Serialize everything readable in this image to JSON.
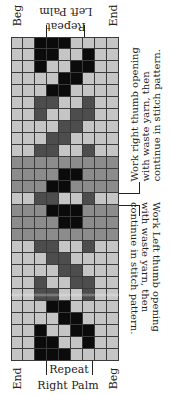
{
  "colors": {
    "L": "#c5c5c5",
    "M": "#8c8c8c",
    "D": "#4d4d4d",
    "B": "#0b0b0b",
    "grid_line": "#3a3a3a"
  },
  "legend_codes": {
    "L": "light gray",
    "M": "medium gray",
    "D": "dark gray",
    "B": "black"
  },
  "chart": {
    "columns": 9,
    "rows": 27,
    "cells": [
      "LLBBBLLLL",
      "LLBBLLBLL",
      "LLBLLBBLL",
      "LLLLBBLLL",
      "LLLBBLLLL",
      "LLDDLLDLL",
      "LLDLLDDLL",
      "LLLLDDLLL",
      "LLLDDLLLL",
      "LLDDLLDLL",
      "MMMMMMMMM",
      "MMMMBBMMM",
      "MMMBBMMMM",
      "LLDDLLDLL",
      "MMMBBBMMM",
      "MMMMBBMMM",
      "MMMMMMMMM",
      "LLDDLLDLL",
      "LLLDDLLLL",
      "LLLLDDLLL",
      "LLDLLDDLL",
      "LLDDLLDLL",
      "LLLBBLLLL",
      "LLLLBBLLL",
      "LLBLLBBLL",
      "LLBBLLBLL",
      "LLBBBLLLL"
    ]
  },
  "top_labels": {
    "beg": "Beg",
    "end": "End",
    "section": "Left Palm",
    "repeat": "Repeat"
  },
  "bottom_labels": {
    "end": "End",
    "beg": "Beg",
    "repeat": "Repeat",
    "section": "Right Palm"
  },
  "notes": {
    "right_thumb": [
      "Work right thumb opening",
      "with waste yarn, then",
      "continue in stitch pattern."
    ],
    "left_thumb": [
      "Work Left thumb opening",
      "with waste yarn, then",
      "continue in stitch pattern."
    ]
  }
}
